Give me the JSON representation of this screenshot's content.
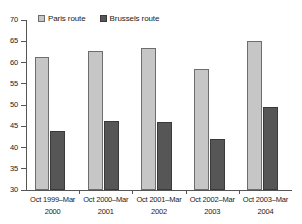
{
  "chart_data": {
    "type": "bar",
    "title": "",
    "subtitle": "",
    "xlabel": "",
    "ylabel": "",
    "ylim": [
      30,
      70
    ],
    "yticks": [
      30,
      35,
      40,
      45,
      50,
      55,
      60,
      65,
      70
    ],
    "grid": false,
    "legend_position": "top-left",
    "categories": [
      "Oct 1999–Mar 2000",
      "Oct 2000–Mar 2001",
      "Oct 2001–Mar 2002",
      "Oct 2002–Mar 2003",
      "Oct 2003–Mar 2004"
    ],
    "category_lines": [
      {
        "line1": "Oct 1999–Mar",
        "line2": "2000"
      },
      {
        "line1": "Oct 2000–Mar",
        "line2": "2001"
      },
      {
        "line1": "Oct 2001–Mar",
        "line2": "2002"
      },
      {
        "line1": "Oct 2002–Mar",
        "line2": "2003"
      },
      {
        "line1": "Oct 2003–Mar",
        "line2": "2004"
      }
    ],
    "series": [
      {
        "name": "Paris route",
        "color": "#c6c6c6",
        "border_color": "#6d6d6d",
        "values": [
          61.4,
          62.8,
          63.4,
          58.4,
          65.1
        ]
      },
      {
        "name": "Brussels route",
        "color": "#565656",
        "border_color": "#3a3a3a",
        "values": [
          43.9,
          46.3,
          46.0,
          41.9,
          49.6
        ]
      }
    ]
  },
  "legend": {
    "items": [
      {
        "label": "Paris route"
      },
      {
        "label": "Brussels route"
      }
    ]
  },
  "axis": {
    "y_tick_labels": [
      "70",
      "65",
      "60",
      "55",
      "50",
      "45",
      "40",
      "35",
      "30"
    ]
  }
}
